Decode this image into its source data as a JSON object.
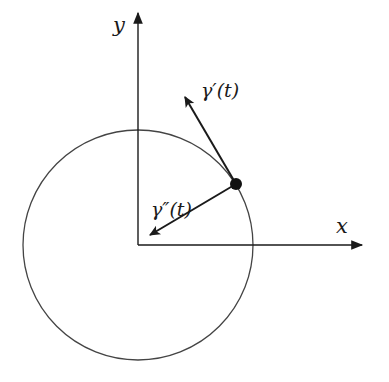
{
  "diagram": {
    "type": "geometry",
    "colors": {
      "stroke": "#1a1a1a",
      "circle": "#444444",
      "background": "#ffffff"
    },
    "axes": {
      "origin": [
        138,
        245
      ],
      "x_axis": {
        "label": "x",
        "end": [
          364,
          245
        ]
      },
      "y_axis": {
        "label": "y",
        "end": [
          138,
          11
        ]
      }
    },
    "circle": {
      "center": [
        138,
        245
      ],
      "radius": 115
    },
    "point": {
      "position": [
        236,
        184
      ],
      "radius": 6
    },
    "vectors": [
      {
        "name": "velocity",
        "label": "γ′(t)",
        "from": [
          236,
          184
        ],
        "to": [
          184,
          95
        ]
      },
      {
        "name": "acceleration",
        "label": "γ″(t)",
        "from": [
          236,
          184
        ],
        "to": [
          148,
          236
        ]
      }
    ]
  }
}
